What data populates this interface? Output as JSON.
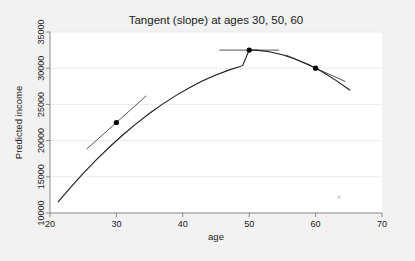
{
  "chart_data": {
    "type": "line",
    "title": "Tangent (slope) at ages 30, 50, 60",
    "xlabel": "age",
    "ylabel": "Predicted income",
    "xlim": [
      20,
      70
    ],
    "ylim": [
      10000,
      35000
    ],
    "xticks": [
      20,
      30,
      40,
      50,
      60,
      70
    ],
    "xtick_labels": [
      "20",
      "30",
      "40",
      "50",
      "60",
      "70"
    ],
    "yticks": [
      10000,
      15000,
      20000,
      25000,
      30000,
      35000
    ],
    "ytick_labels": [
      "10000",
      "15000",
      "20000",
      "25000",
      "30000",
      "35000"
    ],
    "grid": "horizontal",
    "legend": "none",
    "background_color": "#f2f2f2",
    "plot_background_color": "#ffffff",
    "curve_color": "#1a1a1a",
    "tangent_color": "#555555",
    "marker_color": "#000000",
    "series": [
      {
        "name": "Predicted income (quadratic fit)",
        "type": "line",
        "x": [
          21.2,
          23,
          25,
          27,
          29,
          31,
          33,
          35,
          37,
          39,
          41,
          43,
          45,
          47,
          49,
          50,
          51,
          53,
          55,
          57,
          59,
          61,
          63,
          65.2
        ],
        "y": [
          11500,
          13450,
          15470,
          17370,
          19150,
          20810,
          22350,
          23770,
          25070,
          26250,
          27310,
          28250,
          29070,
          29770,
          30350,
          32500,
          32490,
          32270,
          31850,
          31250,
          30470,
          29500,
          28350,
          26950
        ]
      },
      {
        "name": "Tangent at age 30",
        "type": "tangent-segment",
        "at_x": 30,
        "at_y": 22500,
        "slope": 820,
        "x_range": [
          25.5,
          34.5
        ]
      },
      {
        "name": "Tangent at age 50",
        "type": "tangent-segment",
        "at_x": 50,
        "at_y": 32500,
        "slope": 0,
        "x_range": [
          45.5,
          54.5
        ]
      },
      {
        "name": "Tangent at age 60",
        "type": "tangent-segment",
        "at_x": 60,
        "at_y": 30000,
        "slope": -410,
        "x_range": [
          55.5,
          64.5
        ]
      }
    ],
    "markers": [
      {
        "label": "age 30",
        "x": 30,
        "y": 22500
      },
      {
        "label": "age 50",
        "x": 50,
        "y": 32500
      },
      {
        "label": "age 60",
        "x": 60,
        "y": 30000
      }
    ]
  }
}
